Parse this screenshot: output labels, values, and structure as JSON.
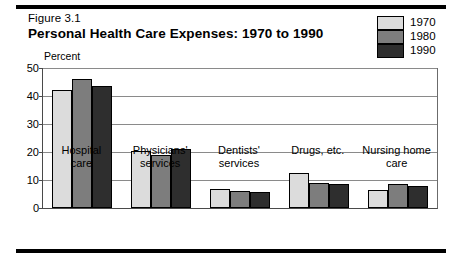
{
  "figure": {
    "number": "Figure 3.1",
    "title": "Personal Health Care Expenses:  1970 to 1990",
    "unit_label": "Percent"
  },
  "legend": {
    "position": "top-right",
    "entries": [
      {
        "label": "1970",
        "color": "#dcdcdc"
      },
      {
        "label": "1980",
        "color": "#7d7d7d"
      },
      {
        "label": "1990",
        "color": "#2e2e2e"
      }
    ]
  },
  "chart_data": {
    "type": "bar",
    "title": "Personal Health Care Expenses:  1970 to 1990",
    "xlabel": "",
    "ylabel": "Percent",
    "ylim": [
      0,
      50
    ],
    "yticks": [
      0,
      10,
      20,
      30,
      40,
      50
    ],
    "grid": true,
    "legend_position": "top-right",
    "categories": [
      "Hospital\ncare",
      "Physicians'\nservices",
      "Dentists'\nservices",
      "Drugs, etc.",
      "Nursing home\ncare"
    ],
    "series": [
      {
        "name": "1970",
        "color": "#dcdcdc",
        "values": [
          42.0,
          20.5,
          6.8,
          12.5,
          6.5
        ]
      },
      {
        "name": "1980",
        "color": "#7d7d7d",
        "values": [
          46.0,
          19.0,
          6.2,
          9.0,
          8.5
        ]
      },
      {
        "name": "1990",
        "color": "#2e2e2e",
        "values": [
          43.5,
          21.0,
          5.8,
          8.5,
          8.0
        ]
      }
    ]
  }
}
